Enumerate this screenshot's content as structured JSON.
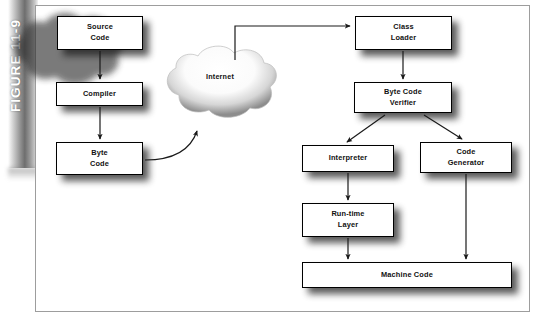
{
  "figure": {
    "label": "FIGURE 11-9"
  },
  "diagram": {
    "type": "flowchart",
    "title": "",
    "nodes": [
      {
        "id": "source-code",
        "label_lines": [
          "Source",
          "Code"
        ],
        "x": 57,
        "y": 16,
        "w": 86,
        "h": 34
      },
      {
        "id": "compiler",
        "label_lines": [
          "Compiler"
        ],
        "x": 56,
        "y": 82,
        "w": 87,
        "h": 24
      },
      {
        "id": "byte-code",
        "label_lines": [
          "Byte",
          "Code"
        ],
        "x": 56,
        "y": 142,
        "w": 87,
        "h": 33
      },
      {
        "id": "internet-cloud",
        "label_lines": [
          "Internet"
        ],
        "x": 160,
        "y": 42,
        "w": 120,
        "h": 82
      },
      {
        "id": "class-loader",
        "label_lines": [
          "Class",
          "Loader"
        ],
        "x": 355,
        "y": 16,
        "w": 97,
        "h": 34
      },
      {
        "id": "byte-code-verifier",
        "label_lines": [
          "Byte Code",
          "Verifier"
        ],
        "x": 354,
        "y": 82,
        "w": 98,
        "h": 31
      },
      {
        "id": "interpreter",
        "label_lines": [
          "Interpreter"
        ],
        "x": 302,
        "y": 145,
        "w": 92,
        "h": 27
      },
      {
        "id": "code-generator",
        "label_lines": [
          "Code",
          "Generator"
        ],
        "x": 420,
        "y": 142,
        "w": 92,
        "h": 31
      },
      {
        "id": "run-time-layer",
        "label_lines": [
          "Run-time",
          "Layer"
        ],
        "x": 302,
        "y": 203,
        "w": 92,
        "h": 34
      },
      {
        "id": "machine-code",
        "label_lines": [
          "Machine Code"
        ],
        "x": 302,
        "y": 262,
        "w": 210,
        "h": 26
      }
    ],
    "edges": [
      {
        "from": "source-code",
        "to": "compiler",
        "style": "straight-down"
      },
      {
        "from": "compiler",
        "to": "byte-code",
        "style": "straight-down"
      },
      {
        "from": "byte-code",
        "to": "internet-cloud",
        "style": "curved-up-right"
      },
      {
        "from": "internet-cloud",
        "to": "class-loader",
        "style": "up-then-right"
      },
      {
        "from": "class-loader",
        "to": "byte-code-verifier",
        "style": "straight-down"
      },
      {
        "from": "byte-code-verifier",
        "to": "interpreter",
        "style": "diagonal-down-left"
      },
      {
        "from": "byte-code-verifier",
        "to": "code-generator",
        "style": "diagonal-down-right"
      },
      {
        "from": "interpreter",
        "to": "run-time-layer",
        "style": "straight-down"
      },
      {
        "from": "run-time-layer",
        "to": "machine-code",
        "style": "straight-down"
      },
      {
        "from": "code-generator",
        "to": "machine-code",
        "style": "straight-down"
      }
    ]
  },
  "colors": {
    "page_background": "#ffffff",
    "frame_border": "#9d9d9d",
    "node_border": "#000000",
    "node_fill": "#ffffff",
    "text": "#111111",
    "arrow": "#1a1a1a",
    "figure_bar_light": "#f2f2f2",
    "figure_bar_dark": "#6e6e6e",
    "figure_label_text": "#ffffff",
    "shadow": "#1b1b1b"
  }
}
